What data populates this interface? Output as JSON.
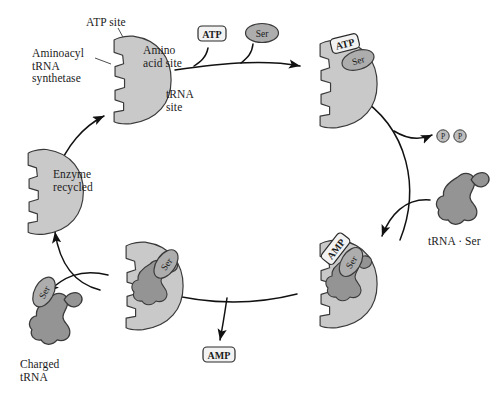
{
  "figure": {
    "background_color": "#ffffff",
    "ink_color": "#1b1b1b"
  },
  "palette": {
    "enzyme_fill": "#c9c9c9",
    "enzyme_stroke": "#3a3a3a",
    "trna_fill": "#949494",
    "trna_stroke": "#3a3a3a",
    "ser_fill": "#adadad",
    "ser_stroke": "#3a3a3a",
    "badge_fill": "#f2f2f2",
    "badge_stroke": "#2b2b2b",
    "phosphate_fill": "#bdbdbd",
    "arrow_color": "#111111"
  },
  "callouts": [
    {
      "name": "atp-site",
      "text": "ATP site",
      "x": 86,
      "y": 16
    },
    {
      "name": "aminoacyl-trna-synthetase",
      "text": "Aminoacyl\ntRNA\nsynthetase",
      "x": 32,
      "y": 47
    },
    {
      "name": "amino-acid-site",
      "text": "Amino\nacid site",
      "x": 143,
      "y": 44
    },
    {
      "name": "trna-site",
      "text": "tRNA\nsite",
      "x": 166,
      "y": 88
    },
    {
      "name": "enzyme-recycled",
      "text": "Enzyme\nrecycled",
      "x": 53,
      "y": 168
    },
    {
      "name": "trna-ser",
      "text": "tRNA · Ser",
      "x": 428,
      "y": 235
    },
    {
      "name": "charged-trna",
      "text": "Charged\ntRNA",
      "x": 20,
      "y": 358
    }
  ],
  "molecules": [
    {
      "name": "atp-input-badge",
      "label": "ATP",
      "kind": "badge",
      "x": 203,
      "y": 32
    },
    {
      "name": "ser-input-ellipse",
      "label": "Ser",
      "kind": "ellipse",
      "x": 250,
      "y": 26
    },
    {
      "name": "atp-bound-badge",
      "label": "ATP",
      "kind": "badge",
      "x": 336,
      "y": 36
    },
    {
      "name": "ser-bound-ellipse",
      "label": "Ser",
      "kind": "ellipse",
      "x": 350,
      "y": 52
    },
    {
      "name": "amp-bound-badge",
      "label": "AMP",
      "kind": "badge",
      "x": 322,
      "y": 240
    },
    {
      "name": "ser-bound-right-ellipse",
      "label": "Ser",
      "kind": "ellipse",
      "x": 342,
      "y": 253
    },
    {
      "name": "ser-bound-left-ellipse",
      "label": "Ser",
      "kind": "ellipse",
      "x": 155,
      "y": 255
    },
    {
      "name": "ser-charged-ellipse",
      "label": "Ser",
      "kind": "ellipse",
      "x": 33,
      "y": 283
    },
    {
      "name": "amp-released-badge",
      "label": "AMP",
      "kind": "badge",
      "x": 203,
      "y": 347
    },
    {
      "name": "pyrophosphate-p1",
      "label": "P",
      "kind": "circle",
      "x": 441,
      "y": 134
    },
    {
      "name": "pyrophosphate-p2",
      "label": "P",
      "kind": "circle",
      "x": 457,
      "y": 134
    }
  ],
  "enzymes": [
    {
      "name": "enzyme-free-top",
      "state": "empty-binding-sites"
    },
    {
      "name": "enzyme-atp-ser-bound",
      "state": "atp-and-ser-bound"
    },
    {
      "name": "enzyme-amp-ser-trna-bound",
      "state": "amp-ser-trna-bound"
    },
    {
      "name": "enzyme-ser-trna-bound",
      "state": "ser-trna-charged"
    },
    {
      "name": "enzyme-recycled",
      "state": "empty-recycled"
    }
  ],
  "trnas": [
    {
      "name": "trna-ser-incoming",
      "charged": false
    },
    {
      "name": "trna-charged-product",
      "charged": true
    }
  ]
}
